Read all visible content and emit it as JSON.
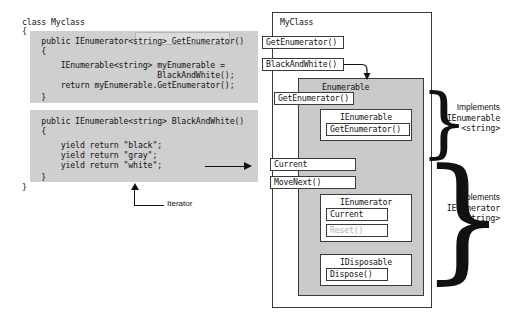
{
  "code": {
    "lines": [
      {
        "text": "class Myclass",
        "x": 22,
        "y": 18
      },
      {
        "text": "{",
        "x": 22,
        "y": 27
      },
      {
        "text": "    public IEnumerator<string> GetEnumerator()",
        "x": 22,
        "y": 37
      },
      {
        "text": "    {",
        "x": 22,
        "y": 47
      },
      {
        "text": "        IEnumerable<string> myEnumerable =",
        "x": 22,
        "y": 61
      },
      {
        "text": "                            BlackAndWhite();",
        "x": 22,
        "y": 71
      },
      {
        "text": "        return myEnumerable.GetEnumerator();",
        "x": 22,
        "y": 81
      },
      {
        "text": "    }",
        "x": 22,
        "y": 93
      },
      {
        "text": "    public IEnumerable<string> BlackAndWhite()",
        "x": 22,
        "y": 117
      },
      {
        "text": "    {",
        "x": 22,
        "y": 127
      },
      {
        "text": "        yield return \"black\";",
        "x": 22,
        "y": 141
      },
      {
        "text": "        yield return \"gray\";",
        "x": 22,
        "y": 151
      },
      {
        "text": "        yield return \"white\";",
        "x": 22,
        "y": 161
      },
      {
        "text": "    }",
        "x": 22,
        "y": 173
      },
      {
        "text": "}",
        "x": 22,
        "y": 183
      }
    ],
    "shade_blocks": [
      {
        "x": 30,
        "y": 31,
        "w": 228,
        "h": 72
      },
      {
        "x": 30,
        "y": 110,
        "w": 228,
        "h": 72
      }
    ],
    "highlight": {
      "x": 135,
      "y": 32,
      "w": 93,
      "h": 11
    }
  },
  "flow_arrow": {
    "name": "compiles-to-arrow"
  },
  "iterator_callout": {
    "label": "Iterator"
  },
  "diagram": {
    "outer_class_title": "MyClass",
    "class_members": [
      {
        "label": "GetEnumerator()",
        "x": 2,
        "y": 30,
        "w": 82,
        "h": 13
      },
      {
        "label": "BlackAndWhite()",
        "x": 2,
        "y": 52,
        "w": 82,
        "h": 13
      }
    ],
    "enumerable_group": {
      "title": "Enumerable",
      "members": [
        {
          "label": "GetEnumerator()",
          "x": 14,
          "y": 86,
          "w": 80,
          "h": 13,
          "dim": false
        },
        {
          "label": "Current",
          "x": 10,
          "y": 152,
          "w": 86,
          "h": 13,
          "dim": false
        },
        {
          "label": "MoveNext()",
          "x": 10,
          "y": 170,
          "w": 86,
          "h": 13,
          "dim": false
        }
      ],
      "interfaces": [
        {
          "title": "IEnumerable",
          "box": {
            "x": 60,
            "y": 103,
            "w": 92,
            "h": 32
          },
          "members": [
            {
              "label": "GetEnumerator()",
              "x": 66,
              "y": 117,
              "w": 84,
              "h": 13,
              "dim": false
            }
          ]
        },
        {
          "title": "IEnumerator",
          "box": {
            "x": 60,
            "y": 188,
            "w": 92,
            "h": 48
          },
          "members": [
            {
              "label": "Current",
              "x": 66,
              "y": 202,
              "w": 62,
              "h": 13,
              "dim": false
            },
            {
              "label": "Reset()",
              "x": 66,
              "y": 218,
              "w": 62,
              "h": 13,
              "dim": true
            }
          ]
        },
        {
          "title": "IDisposable",
          "box": {
            "x": 60,
            "y": 248,
            "w": 92,
            "h": 32
          },
          "members": [
            {
              "label": "Dispose()",
              "x": 66,
              "y": 262,
              "w": 62,
              "h": 13,
              "dim": false
            }
          ]
        }
      ]
    },
    "annotations": [
      {
        "brace": "}",
        "brace_x": 160,
        "brace_y": 78,
        "brace_size": 76,
        "l1": "Implements",
        "l2": "IEnumerable",
        "l3": "<string>",
        "label_x": 174,
        "label_y": 96
      },
      {
        "brace": "}",
        "brace_x": 160,
        "brace_y": 145,
        "brace_size": 135,
        "l1": "Implements",
        "l2": "IEnumerator",
        "l3": "<string>",
        "label_x": 174,
        "label_y": 186
      }
    ]
  }
}
